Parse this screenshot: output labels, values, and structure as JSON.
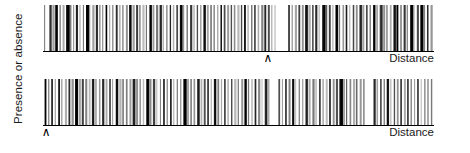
{
  "figure": {
    "ylabel": "Presence or absence",
    "panels": [
      {
        "id": "top",
        "xlabel": "Distance",
        "marker_glyph": "∧",
        "marker_position_pct": 57.5
      },
      {
        "id": "bottom",
        "xlabel": "Distance",
        "marker_glyph": "∧",
        "marker_position_pct": 0.8
      }
    ]
  },
  "chart_data": [
    {
      "type": "bar",
      "title": "",
      "subtitle": "",
      "xlabel": "Distance",
      "ylabel": "Presence or absence",
      "grid": false,
      "legend": null,
      "axis_range_x": [
        0,
        100
      ],
      "axis_range_y": [
        0,
        1
      ],
      "panel": "top",
      "annotations": [
        {
          "text": "∧",
          "x_pct": 57.5,
          "y": "below-axis"
        }
      ],
      "note": "Barcode / rug strip plot: each vertical line is an occurrence along distance; line darkness encodes intensity (0 = white, 1 = black) and width encodes extent.",
      "x_pct": [
        0.3,
        1.6,
        2.4,
        3.1,
        4.2,
        5.0,
        5.9,
        6.8,
        7.7,
        8.4,
        9.3,
        10.2,
        11.0,
        11.8,
        12.6,
        13.5,
        14.4,
        15.1,
        16.0,
        16.9,
        17.7,
        18.6,
        19.4,
        20.3,
        21.2,
        22.0,
        22.9,
        23.8,
        24.6,
        25.4,
        26.3,
        27.2,
        28.0,
        28.9,
        29.8,
        30.6,
        31.5,
        32.4,
        33.2,
        34.1,
        35.0,
        35.8,
        36.7,
        37.6,
        38.4,
        39.3,
        40.2,
        41.0,
        41.9,
        42.8,
        43.6,
        44.5,
        45.4,
        46.2,
        47.1,
        48.0,
        48.8,
        49.7,
        50.6,
        51.4,
        52.3,
        53.2,
        54.0,
        54.9,
        55.8,
        56.6,
        57.5,
        58.4,
        59.2,
        60.1,
        61.0,
        61.8,
        62.7,
        63.6,
        64.4,
        65.3,
        66.2,
        67.0,
        67.9,
        68.8,
        69.6,
        70.5,
        71.4,
        72.2,
        73.1,
        74.0,
        74.8,
        75.7,
        76.6,
        77.4,
        78.3,
        79.2,
        80.0,
        80.9,
        81.8,
        82.6,
        83.5,
        84.4,
        85.2,
        86.1,
        87.0,
        87.8,
        88.7,
        89.6,
        90.4,
        91.3,
        92.2,
        93.0,
        93.9,
        94.8,
        95.6,
        96.5,
        97.4,
        98.2,
        99.1
      ],
      "values": [
        0.55,
        0.62,
        0.35,
        0.8,
        0.45,
        0.3,
        0.9,
        0.5,
        0.4,
        0.75,
        0.28,
        0.6,
        0.95,
        0.42,
        0.33,
        0.7,
        0.52,
        0.38,
        0.85,
        0.3,
        0.48,
        0.66,
        0.25,
        0.58,
        0.4,
        0.78,
        0.34,
        0.62,
        0.45,
        0.22,
        0.55,
        0.88,
        0.36,
        0.5,
        0.68,
        0.3,
        0.44,
        0.72,
        0.26,
        0.58,
        0.92,
        0.38,
        0.48,
        0.64,
        0.2,
        0.55,
        0.4,
        0.76,
        0.32,
        0.6,
        0.46,
        0.28,
        0.84,
        0.52,
        0.36,
        0.68,
        0.42,
        0.24,
        0.58,
        0.8,
        0.34,
        0.5,
        0.62,
        0.3,
        0.45,
        0.7,
        0.56,
        0.38,
        0.26,
        0.0,
        0.0,
        0.0,
        0.65,
        0.48,
        0.32,
        0.58,
        0.4,
        0.74,
        0.28,
        0.52,
        0.66,
        0.36,
        0.9,
        0.44,
        0.6,
        0.3,
        0.96,
        0.5,
        0.38,
        0.72,
        0.26,
        0.55,
        0.42,
        0.68,
        0.34,
        0.58,
        0.46,
        0.8,
        0.3,
        0.64,
        0.4,
        0.52,
        0.28,
        0.75,
        0.98,
        0.36,
        0.6,
        0.44,
        0.94,
        0.32,
        0.56,
        0.99,
        0.48,
        0.7,
        0.38
      ]
    },
    {
      "type": "bar",
      "title": "",
      "subtitle": "",
      "xlabel": "Distance",
      "ylabel": "Presence or absence",
      "grid": false,
      "legend": null,
      "axis_range_x": [
        0,
        100
      ],
      "axis_range_y": [
        0,
        1
      ],
      "panel": "bottom",
      "annotations": [
        {
          "text": "∧",
          "x_pct": 0.8,
          "y": "below-axis"
        }
      ],
      "note": "Barcode / rug strip plot: each vertical line is an occurrence along distance; line darkness encodes intensity (0 = white, 1 = black) and width encodes extent.",
      "x_pct": [
        0.4,
        1.3,
        2.1,
        3.0,
        3.9,
        4.7,
        5.6,
        6.5,
        7.3,
        8.2,
        9.1,
        9.9,
        10.8,
        11.7,
        12.5,
        13.4,
        14.3,
        15.1,
        16.0,
        16.9,
        17.7,
        18.6,
        19.5,
        20.3,
        21.2,
        22.1,
        22.9,
        23.8,
        24.7,
        25.5,
        26.4,
        27.3,
        28.1,
        29.0,
        29.9,
        30.7,
        31.6,
        32.5,
        33.3,
        34.2,
        35.1,
        35.9,
        36.8,
        37.7,
        38.5,
        39.4,
        40.3,
        41.1,
        42.0,
        42.9,
        43.7,
        44.6,
        45.5,
        46.3,
        47.2,
        48.1,
        48.9,
        49.8,
        50.7,
        51.5,
        52.4,
        53.3,
        54.1,
        55.0,
        55.9,
        56.7,
        57.6,
        58.5,
        59.3,
        60.2,
        61.1,
        61.9,
        62.8,
        63.7,
        64.5,
        65.4,
        66.3,
        67.1,
        68.0,
        68.9,
        69.7,
        70.6,
        71.5,
        72.3,
        73.2,
        74.1,
        74.9,
        75.8,
        76.7,
        77.5,
        78.4,
        79.3,
        80.1,
        81.0,
        81.9,
        82.7,
        83.6,
        84.5,
        85.3,
        86.2,
        87.1,
        87.9,
        88.8,
        89.7,
        90.5,
        91.4,
        92.3,
        93.1,
        94.0,
        94.9,
        95.7,
        96.6,
        97.5,
        98.3,
        99.2
      ],
      "values": [
        0.9,
        0.45,
        0.7,
        0.36,
        0.82,
        0.52,
        0.28,
        0.64,
        0.4,
        0.95,
        0.33,
        0.58,
        0.46,
        0.24,
        0.76,
        0.5,
        0.38,
        0.68,
        0.3,
        0.54,
        0.42,
        0.86,
        0.26,
        0.6,
        0.48,
        0.34,
        0.72,
        0.4,
        0.56,
        0.22,
        0.92,
        0.44,
        0.62,
        0.3,
        0.5,
        0.66,
        0.38,
        0.78,
        0.28,
        0.54,
        0.46,
        0.98,
        0.32,
        0.58,
        0.4,
        0.7,
        0.26,
        0.52,
        0.64,
        0.36,
        0.84,
        0.48,
        0.3,
        0.6,
        0.42,
        0.74,
        0.24,
        0.56,
        0.38,
        0.88,
        0.5,
        0.32,
        0.66,
        0.44,
        0.28,
        0.72,
        0.4,
        0.0,
        0.0,
        0.55,
        0.34,
        0.62,
        0.46,
        0.8,
        0.26,
        0.58,
        0.42,
        0.68,
        0.3,
        0.5,
        0.36,
        0.64,
        0.48,
        0.22,
        0.76,
        0.4,
        0.56,
        0.94,
        0.32,
        0.6,
        0.44,
        0.28,
        0.7,
        0.38,
        0.52,
        0.0,
        0.0,
        0.66,
        0.34,
        0.58,
        0.46,
        0.82,
        0.24,
        0.54,
        0.4,
        0.72,
        0.3,
        0.62,
        0.48,
        0.36,
        0.68,
        0.26,
        0.5
      ]
    }
  ]
}
